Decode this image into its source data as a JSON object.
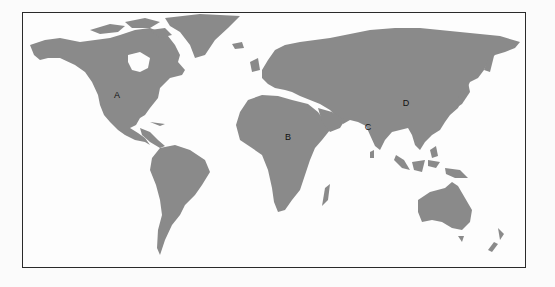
{
  "map": {
    "type": "world-map",
    "land_color": "#8a8a8a",
    "background_color": "#fdfdfd",
    "frame_color": "#2a2a2a",
    "labels": [
      {
        "id": "A",
        "text": "A",
        "region": "North America (central USA)",
        "x": 117,
        "y": 95
      },
      {
        "id": "B",
        "text": "B",
        "region": "Central Africa",
        "x": 288,
        "y": 137
      },
      {
        "id": "C",
        "text": "C",
        "region": "India",
        "x": 368,
        "y": 127
      },
      {
        "id": "D",
        "text": "D",
        "region": "China",
        "x": 406,
        "y": 103
      }
    ]
  }
}
